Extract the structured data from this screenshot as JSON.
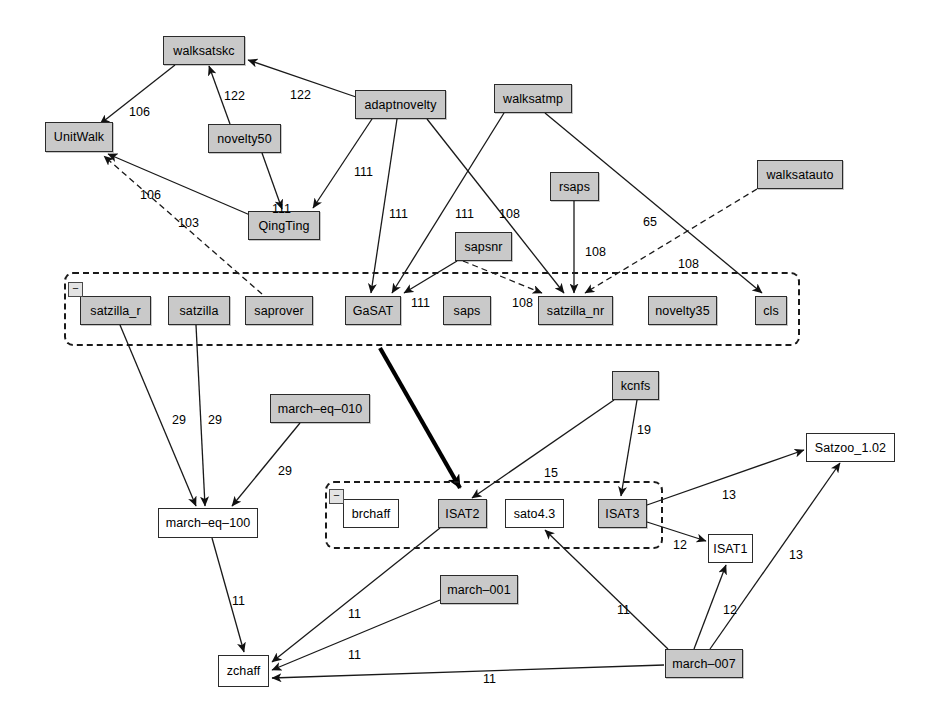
{
  "diagram": {
    "type": "directed-graph",
    "colors": {
      "node_fill": "#c9c9c9",
      "node_fill_alt": "#ffffff",
      "node_stroke": "#2b2b2b",
      "edge": "#1a1a1a",
      "group_border": "#1a1a1a",
      "background": "#ffffff"
    },
    "groups": [
      {
        "name": "group-satzilla-row",
        "collapse_label": "−",
        "x": 64,
        "y": 272,
        "w": 736,
        "h": 74
      },
      {
        "name": "group-isat-row",
        "collapse_label": "−",
        "x": 325,
        "y": 481,
        "w": 338,
        "h": 68
      }
    ],
    "nodes": [
      {
        "id": "walksatskc",
        "label": "walksatskc",
        "x": 163,
        "y": 36,
        "w": 82,
        "h": 29,
        "fill": "gray"
      },
      {
        "id": "adaptnovelty",
        "label": "adaptnovelty",
        "x": 355,
        "y": 90,
        "w": 91,
        "h": 29,
        "fill": "gray"
      },
      {
        "id": "walksatmp",
        "label": "walksatmp",
        "x": 494,
        "y": 84,
        "w": 78,
        "h": 29,
        "fill": "gray"
      },
      {
        "id": "UnitWalk",
        "label": "UnitWalk",
        "x": 45,
        "y": 122,
        "w": 68,
        "h": 30,
        "fill": "gray"
      },
      {
        "id": "novelty50",
        "label": "novelty50",
        "x": 208,
        "y": 124,
        "w": 73,
        "h": 29,
        "fill": "gray"
      },
      {
        "id": "walksatauto",
        "label": "walksatauto",
        "x": 757,
        "y": 160,
        "w": 86,
        "h": 29,
        "fill": "gray"
      },
      {
        "id": "rsaps",
        "label": "rsaps",
        "x": 550,
        "y": 172,
        "w": 49,
        "h": 29,
        "fill": "gray"
      },
      {
        "id": "QingTing",
        "label": "QingTing",
        "x": 248,
        "y": 211,
        "w": 72,
        "h": 29,
        "fill": "gray"
      },
      {
        "id": "sapsnr",
        "label": "sapsnr",
        "x": 455,
        "y": 232,
        "w": 57,
        "h": 29,
        "fill": "gray"
      },
      {
        "id": "satzilla_r",
        "label": "satzilla_r",
        "x": 80,
        "y": 296,
        "w": 71,
        "h": 29,
        "fill": "gray"
      },
      {
        "id": "satzilla",
        "label": "satzilla",
        "x": 168,
        "y": 296,
        "w": 62,
        "h": 29,
        "fill": "gray"
      },
      {
        "id": "saprover",
        "label": "saprover",
        "x": 245,
        "y": 296,
        "w": 68,
        "h": 29,
        "fill": "gray"
      },
      {
        "id": "GaSAT",
        "label": "GaSAT",
        "x": 345,
        "y": 296,
        "w": 56,
        "h": 29,
        "fill": "gray"
      },
      {
        "id": "saps",
        "label": "saps",
        "x": 443,
        "y": 296,
        "w": 48,
        "h": 29,
        "fill": "gray"
      },
      {
        "id": "satzilla_nr",
        "label": "satzilla_nr",
        "x": 538,
        "y": 296,
        "w": 75,
        "h": 29,
        "fill": "gray"
      },
      {
        "id": "novelty35",
        "label": "novelty35",
        "x": 648,
        "y": 296,
        "w": 69,
        "h": 29,
        "fill": "gray"
      },
      {
        "id": "cls",
        "label": "cls",
        "x": 755,
        "y": 296,
        "w": 32,
        "h": 29,
        "fill": "gray"
      },
      {
        "id": "kcnfs",
        "label": "kcnfs",
        "x": 612,
        "y": 371,
        "w": 47,
        "h": 29,
        "fill": "gray"
      },
      {
        "id": "march-eq-010",
        "label": "march–eq–010",
        "x": 270,
        "y": 394,
        "w": 100,
        "h": 29,
        "fill": "gray"
      },
      {
        "id": "Satzoo_1.02",
        "label": "Satzoo_1.02",
        "x": 806,
        "y": 433,
        "w": 89,
        "h": 29,
        "fill": "white"
      },
      {
        "id": "brchaff",
        "label": "brchaff",
        "x": 343,
        "y": 499,
        "w": 56,
        "h": 29,
        "fill": "white"
      },
      {
        "id": "ISAT2",
        "label": "ISAT2",
        "x": 438,
        "y": 499,
        "w": 49,
        "h": 29,
        "fill": "gray"
      },
      {
        "id": "sato4.3",
        "label": "sato4.3",
        "x": 505,
        "y": 499,
        "w": 59,
        "h": 29,
        "fill": "white"
      },
      {
        "id": "ISAT3",
        "label": "ISAT3",
        "x": 598,
        "y": 499,
        "w": 49,
        "h": 29,
        "fill": "gray"
      },
      {
        "id": "march-eq-100",
        "label": "march–eq–100",
        "x": 158,
        "y": 508,
        "w": 100,
        "h": 30,
        "fill": "white"
      },
      {
        "id": "ISAT1",
        "label": "ISAT1",
        "x": 708,
        "y": 534,
        "w": 45,
        "h": 29,
        "fill": "white"
      },
      {
        "id": "march-001",
        "label": "march–001",
        "x": 440,
        "y": 575,
        "w": 78,
        "h": 29,
        "fill": "gray"
      },
      {
        "id": "zchaff",
        "label": "zchaff",
        "x": 218,
        "y": 655,
        "w": 51,
        "h": 32,
        "fill": "white"
      },
      {
        "id": "march-007",
        "label": "march–007",
        "x": 665,
        "y": 649,
        "w": 78,
        "h": 29,
        "fill": "gray"
      }
    ],
    "edges": [
      {
        "from": "walksatskc",
        "to": "UnitWalk",
        "label": "106",
        "lx": 129,
        "ly": 105,
        "style": "solid"
      },
      {
        "from": "novelty50",
        "to": "walksatskc",
        "label": "122",
        "lx": 224,
        "ly": 89,
        "style": "solid"
      },
      {
        "from": "adaptnovelty",
        "to": "walksatskc",
        "label": "122",
        "lx": 290,
        "ly": 88,
        "style": "solid"
      },
      {
        "from": "QingTing",
        "to": "UnitWalk",
        "label": "106",
        "lx": 140,
        "ly": 188,
        "style": "solid"
      },
      {
        "from": "saprover",
        "to": "UnitWalk",
        "label": "103",
        "lx": 178,
        "ly": 216,
        "style": "dashed"
      },
      {
        "from": "novelty50",
        "to": "QingTing",
        "label": "111",
        "lx": 272,
        "ly": 202,
        "style": "solid"
      },
      {
        "from": "adaptnovelty",
        "to": "QingTing",
        "label": "111",
        "lx": 354,
        "ly": 165,
        "style": "solid"
      },
      {
        "from": "adaptnovelty",
        "to": "GaSAT",
        "label": "111",
        "lx": 389,
        "ly": 207,
        "style": "solid"
      },
      {
        "from": "walksatmp",
        "to": "GaSAT",
        "label": "111",
        "lx": 455,
        "ly": 207,
        "style": "solid"
      },
      {
        "from": "adaptnovelty",
        "to": "satzilla_nr",
        "label": "108",
        "lx": 499,
        "ly": 207,
        "style": "solid"
      },
      {
        "from": "sapsnr",
        "to": "GaSAT",
        "label": "111",
        "lx": 411,
        "ly": 296,
        "style": "solid"
      },
      {
        "from": "sapsnr",
        "to": "satzilla_nr",
        "label": "108",
        "lx": 512,
        "ly": 296,
        "style": "dashed"
      },
      {
        "from": "rsaps",
        "to": "satzilla_nr",
        "label": "108",
        "lx": 585,
        "ly": 245,
        "style": "solid"
      },
      {
        "from": "walksatmp",
        "to": "cls",
        "label": "65",
        "lx": 643,
        "ly": 215,
        "style": "solid"
      },
      {
        "from": "walksatauto",
        "to": "satzilla_nr",
        "label": "108",
        "lx": 678,
        "ly": 257,
        "style": "dashed"
      },
      {
        "from": "satzilla_r",
        "to": "march-eq-100",
        "label": "29",
        "lx": 172,
        "ly": 413,
        "style": "solid"
      },
      {
        "from": "satzilla",
        "to": "march-eq-100",
        "label": "29",
        "lx": 208,
        "ly": 413,
        "style": "solid"
      },
      {
        "from": "march-eq-010",
        "to": "march-eq-100",
        "label": "29",
        "lx": 278,
        "ly": 464,
        "style": "solid"
      },
      {
        "from": "GaSAT",
        "to": "ISAT2",
        "label": "",
        "lx": 0,
        "ly": 0,
        "style": "thick"
      },
      {
        "from": "kcnfs",
        "to": "ISAT2",
        "label": "15",
        "lx": 544,
        "ly": 466,
        "style": "solid"
      },
      {
        "from": "kcnfs",
        "to": "ISAT3",
        "label": "19",
        "lx": 637,
        "ly": 423,
        "style": "solid"
      },
      {
        "from": "ISAT3",
        "to": "Satzoo_1.02",
        "label": "13",
        "lx": 722,
        "ly": 488,
        "style": "solid"
      },
      {
        "from": "ISAT3",
        "to": "ISAT1",
        "label": "12",
        "lx": 673,
        "ly": 538,
        "style": "solid"
      },
      {
        "from": "march-007",
        "to": "Satzoo_1.02",
        "label": "13",
        "lx": 789,
        "ly": 548,
        "style": "solid"
      },
      {
        "from": "march-007",
        "to": "ISAT1",
        "label": "12",
        "lx": 723,
        "ly": 603,
        "style": "solid"
      },
      {
        "from": "march-eq-100",
        "to": "zchaff",
        "label": "11",
        "lx": 232,
        "ly": 594,
        "style": "solid"
      },
      {
        "from": "ISAT2",
        "to": "zchaff",
        "label": "11",
        "lx": 348,
        "ly": 607,
        "style": "solid"
      },
      {
        "from": "march-001",
        "to": "zchaff",
        "label": "11",
        "lx": 348,
        "ly": 648,
        "style": "solid"
      },
      {
        "from": "march-007",
        "to": "zchaff",
        "label": "11",
        "lx": 483,
        "ly": 672,
        "style": "solid"
      },
      {
        "from": "march-007",
        "to": "sato4.3",
        "label": "11",
        "lx": 617,
        "ly": 603,
        "style": "solid"
      }
    ]
  }
}
